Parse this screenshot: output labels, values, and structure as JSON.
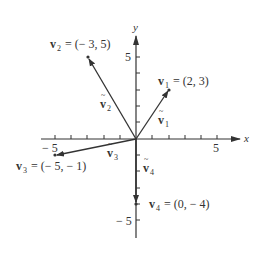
{
  "diagram": {
    "type": "vector-plot",
    "axes": {
      "x_label": "x",
      "y_label": "y",
      "tick_labels": {
        "x_neg": "− 5",
        "x_pos": "5",
        "y_pos": "5",
        "y_neg": "− 5"
      },
      "range": [
        -5,
        5
      ]
    },
    "vectors": [
      {
        "name": "v1",
        "label_main": "v",
        "sub": "1",
        "eq": "= (2, 3)",
        "arrow_label": "v⃗₁",
        "x": 2,
        "y": 3
      },
      {
        "name": "v2",
        "label_main": "v",
        "sub": "2",
        "eq": "= (− 3, 5)",
        "arrow_label": "v⃗₂",
        "x": -3,
        "y": 5
      },
      {
        "name": "v3",
        "label_main": "v",
        "sub": "3",
        "eq": "= (− 5, − 1)",
        "arrow_label": "v⃗₃",
        "x": -5,
        "y": -1
      },
      {
        "name": "v4",
        "label_main": "v",
        "sub": "4",
        "eq": "= (0, − 4)",
        "arrow_label": "v⃗₄",
        "x": 0,
        "y": -4
      }
    ],
    "colors": {
      "ink": "#333333",
      "background": "#ffffff"
    }
  }
}
